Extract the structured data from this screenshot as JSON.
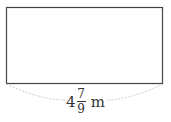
{
  "diagram": {
    "shape": "rectangle",
    "stroke_color": "#444444",
    "brace_color": "#cccccc",
    "width_label": {
      "whole": "4",
      "numerator": "7",
      "denominator": "9",
      "unit": "m"
    }
  }
}
